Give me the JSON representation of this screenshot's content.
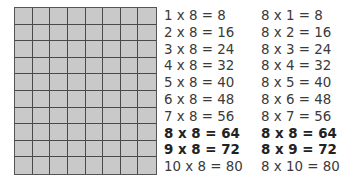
{
  "grid": {
    "columns": 8,
    "rows": 10,
    "fill": "#c9c9c9",
    "line": "#4a4a4a"
  },
  "facts_left": [
    {
      "text": "1 x 8 = 8",
      "bold": false
    },
    {
      "text": "2 x 8 = 16",
      "bold": false
    },
    {
      "text": "3 x 8 = 24",
      "bold": false
    },
    {
      "text": "4 x 8 = 32",
      "bold": false
    },
    {
      "text": "5 x 8 = 40",
      "bold": false
    },
    {
      "text": "6 x 8 = 48",
      "bold": false
    },
    {
      "text": "7 x 8 = 56",
      "bold": false
    },
    {
      "text": "8 x 8 = 64",
      "bold": true
    },
    {
      "text": "9 x 8 = 72",
      "bold": true
    },
    {
      "text": "10 x 8 = 80",
      "bold": false
    }
  ],
  "facts_right": [
    {
      "text": "8 x 1 = 8",
      "bold": false
    },
    {
      "text": "8 x 2 = 16",
      "bold": false
    },
    {
      "text": "8 x 3 = 24",
      "bold": false
    },
    {
      "text": "8 x 4 = 32",
      "bold": false
    },
    {
      "text": "8 x 5 = 40",
      "bold": false
    },
    {
      "text": "8 x 6 = 48",
      "bold": false
    },
    {
      "text": "8 x 7 = 56",
      "bold": false
    },
    {
      "text": "8 x 8 = 64",
      "bold": true
    },
    {
      "text": "8 x 9 = 72",
      "bold": true
    },
    {
      "text": "8 x 10 = 80",
      "bold": false
    }
  ]
}
